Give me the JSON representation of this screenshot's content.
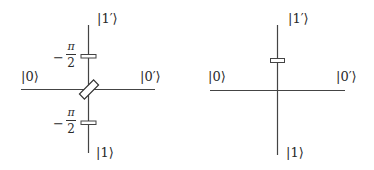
{
  "left_diagram": {
    "labels": {
      "top": "|1′⟩",
      "left": "|0⟩",
      "right": "|0′⟩",
      "bottom": "|1⟩"
    },
    "phase_top": {
      "sign": "−",
      "numerator": "π",
      "denominator": "2"
    },
    "phase_bottom": {
      "sign": "−",
      "numerator": "π",
      "denominator": "2"
    },
    "components": [
      "beam-splitter",
      "phase-plate-top",
      "phase-plate-bottom"
    ]
  },
  "right_diagram": {
    "labels": {
      "top": "|1′⟩",
      "left": "|0⟩",
      "right": "|0′⟩",
      "bottom": "|1⟩"
    },
    "components": [
      "phase-plate-top"
    ]
  },
  "colors": {
    "line": "#444444",
    "background": "#ffffff"
  }
}
